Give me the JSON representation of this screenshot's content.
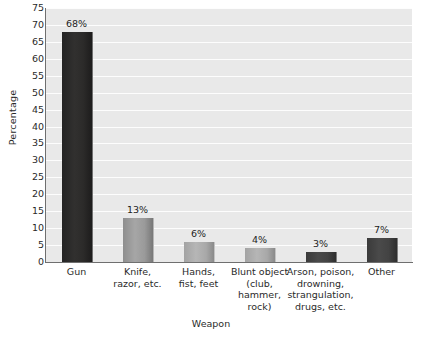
{
  "chart_data": {
    "type": "bar",
    "title": "",
    "xlabel": "Weapon",
    "ylabel": "Percentage",
    "categories": [
      "Gun",
      "Knife,\nrazor, etc.",
      "Hands,\nfist, feet",
      "Blunt object\n(club,\nhammer,\nrock)",
      "Arson, poison,\ndrowning,\nstrangulation,\ndrugs, etc.",
      "Other"
    ],
    "values": [
      68,
      13,
      6,
      4,
      3,
      7
    ],
    "value_labels": [
      "68%",
      "13%",
      "6%",
      "4%",
      "3%",
      "7%"
    ],
    "ylim": [
      0,
      75
    ],
    "ytick_step": 5,
    "yticks": [
      0,
      5,
      10,
      15,
      20,
      25,
      30,
      35,
      40,
      45,
      50,
      55,
      60,
      65,
      70,
      75
    ],
    "ytick_labels": [
      "0",
      "5",
      "10",
      "15",
      "20",
      "25",
      "30",
      "35",
      "40",
      "45",
      "50",
      "55",
      "60",
      "65",
      "70",
      "75"
    ],
    "grid": true,
    "grid_orientation": "horizontal",
    "legend": false,
    "bar_colors": [
      "#2c2b2a",
      "#9a9a9a",
      "#a8a8a8",
      "#a8a8a8",
      "#434343",
      "#434343"
    ],
    "plot_background": "#e9e9e9",
    "gridline_color": "#fdfdfd",
    "axis_color": "#6f6f6f"
  }
}
